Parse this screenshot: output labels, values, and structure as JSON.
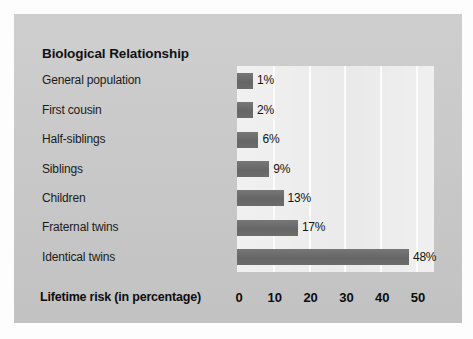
{
  "chart_data": {
    "type": "bar",
    "orientation": "horizontal",
    "title": "Biological Relationship",
    "xlabel": "Lifetime risk (in percentage)",
    "ylabel": "",
    "categories": [
      "General population",
      "First cousin",
      "Half-siblings",
      "Siblings",
      "Children",
      "Fraternal twins",
      "Identical twins"
    ],
    "values": [
      1,
      2,
      6,
      9,
      13,
      17,
      48
    ],
    "value_labels": [
      "1%",
      "2%",
      "6%",
      "9%",
      "13%",
      "17%",
      "48%"
    ],
    "xlim": [
      0,
      55
    ],
    "xticks": [
      0,
      10,
      20,
      30,
      40,
      50
    ],
    "xtick_labels": [
      "0",
      "10",
      "20",
      "30",
      "40",
      "50"
    ],
    "grid": true,
    "grid_axis": "x",
    "legend": null,
    "bar_color": "#6e6e6e",
    "plot_background": "#e9e9e9",
    "panel_background": "#c9c9c9",
    "gridline_color": "#fbfbfb",
    "text_color": "#141414"
  }
}
